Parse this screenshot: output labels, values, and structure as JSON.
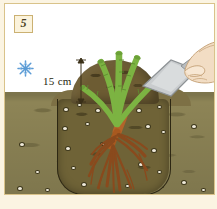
{
  "figure": {
    "step_number": "5",
    "step_badge_name": "step-number-badge",
    "dimension_label": "15 cm",
    "caption_faint": "",
    "icons": {
      "snowflake": "snowflake-icon",
      "hand": "hand-icon",
      "trowel": "trowel-icon"
    },
    "colors": {
      "frame_border": "#d9c38a",
      "page_background": "#fbf4e2",
      "sky": "#ffffff",
      "topsoil": "#8d8456",
      "backfill_soil": "#6f6337",
      "mound_soil": "#6d5c33",
      "cane_green": "#7cb342",
      "root_brown": "#b3642a",
      "snowflake_blue": "#5b9bd5",
      "trowel_metal": "#c9ccce",
      "skin": "#f2ddc4",
      "badge_fill": "#fbf3dc"
    },
    "scene": {
      "title": "Rose planting cross-section",
      "elements": [
        "soil-mound",
        "rose-canes",
        "root-system",
        "planting-hole",
        "gravel-pebbles",
        "hand-with-trowel",
        "dimension-arrow"
      ]
    }
  }
}
